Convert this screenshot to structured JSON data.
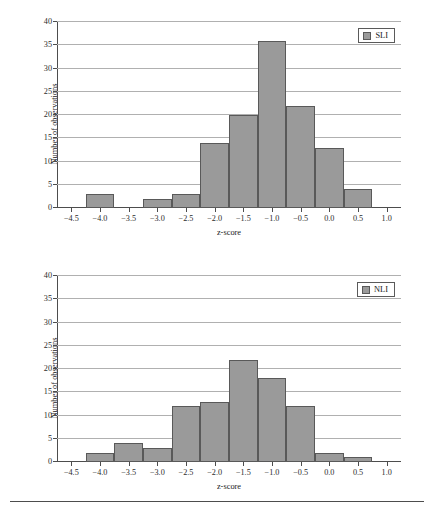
{
  "figure": {
    "background": "#ffffff",
    "bar_fill": "#9a9a9a",
    "bar_edge": "#595959",
    "grid_color": "#b0b0b0",
    "axis_color": "#4d4d4d"
  },
  "chart_data": [
    {
      "type": "bar",
      "title": "",
      "xlabel": "z-score",
      "ylabel": "Number of observations",
      "legend": [
        "SLI"
      ],
      "legend_position": "top-right",
      "grid": true,
      "xlim": [
        -4.75,
        1.25
      ],
      "ylim": [
        0,
        40
      ],
      "xticks": [
        -4.5,
        -4.0,
        -3.5,
        -3.0,
        -2.5,
        -2.0,
        -1.5,
        -1.0,
        -0.5,
        0.0,
        0.5,
        1.0
      ],
      "xticklabels": [
        "−4.5",
        "−4.0",
        "−3.5",
        "−3.0",
        "−2.5",
        "−2.0",
        "−1.5",
        "−1.0",
        "−0.5",
        "0.0",
        "0.5",
        "1.0"
      ],
      "yticks": [
        0,
        5,
        10,
        15,
        20,
        25,
        30,
        35,
        40
      ],
      "yticklabels": [
        "0",
        "5",
        "10",
        "15",
        "20",
        "25",
        "30",
        "35",
        "40"
      ],
      "bin_width": 0.5,
      "categories": [
        -4.5,
        -4.0,
        -3.5,
        -3.0,
        -2.5,
        -2.0,
        -1.5,
        -1.0,
        -0.5,
        0.0,
        0.5,
        1.0
      ],
      "values": [
        0,
        3,
        0,
        2,
        3,
        14,
        20,
        36,
        22,
        13,
        4,
        0
      ]
    },
    {
      "type": "bar",
      "title": "",
      "xlabel": "z-score",
      "ylabel": "Number of observations",
      "legend": [
        "NLI"
      ],
      "legend_position": "top-right",
      "grid": true,
      "xlim": [
        -4.75,
        1.25
      ],
      "ylim": [
        0,
        40
      ],
      "xticks": [
        -4.5,
        -4.0,
        -3.5,
        -3.0,
        -2.5,
        -2.0,
        -1.5,
        -1.0,
        -0.5,
        0.0,
        0.5,
        1.0
      ],
      "xticklabels": [
        "−4.5",
        "−4.0",
        "−3.5",
        "−3.0",
        "−2.5",
        "−2.0",
        "−1.5",
        "−1.0",
        "−0.5",
        "0.0",
        "0.5",
        "1.0"
      ],
      "yticks": [
        0,
        5,
        10,
        15,
        20,
        25,
        30,
        35,
        40
      ],
      "yticklabels": [
        "0",
        "5",
        "10",
        "15",
        "20",
        "25",
        "30",
        "35",
        "40"
      ],
      "bin_width": 0.5,
      "categories": [
        -4.5,
        -4.0,
        -3.5,
        -3.0,
        -2.5,
        -2.0,
        -1.5,
        -1.0,
        -0.5,
        0.0,
        0.5,
        1.0
      ],
      "values": [
        0,
        2,
        4,
        3,
        12,
        13,
        22,
        18,
        12,
        2,
        1,
        0
      ]
    }
  ]
}
